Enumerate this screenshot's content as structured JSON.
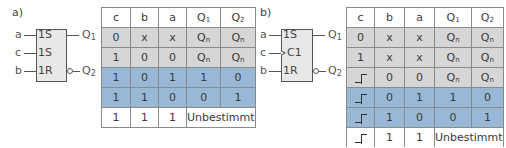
{
  "panels": [
    {
      "label": "a)",
      "block": {
        "inputs": [
          {
            "signal": "a",
            "pin": "1S"
          },
          {
            "signal": "c",
            "pin": "1S"
          },
          {
            "signal": "b",
            "pin": "1R"
          }
        ],
        "outputs": [
          {
            "name": "Q",
            "sub": "1",
            "inverted": false
          },
          {
            "name": "Q",
            "sub": "2",
            "inverted": true
          }
        ]
      },
      "table": {
        "headers": [
          "c",
          "b",
          "a",
          "Q1",
          "Q2"
        ],
        "rows": [
          {
            "style": "gray",
            "cells": [
              "0",
              "x",
              "x",
              "Qn",
              "Qn"
            ]
          },
          {
            "style": "gray",
            "cells": [
              "1",
              "0",
              "0",
              "Qn",
              "Qn"
            ]
          },
          {
            "style": "blue",
            "cells": [
              "1",
              "0",
              "1",
              "1",
              "0"
            ]
          },
          {
            "style": "blue",
            "cells": [
              "1",
              "1",
              "0",
              "0",
              "1"
            ]
          },
          {
            "style": "white",
            "cells": [
              "1",
              "1",
              "1",
              "Unbestimmt"
            ]
          }
        ]
      }
    },
    {
      "label": "b)",
      "block": {
        "inputs": [
          {
            "signal": "a",
            "pin": "1S"
          },
          {
            "signal": "c",
            "pin": "C1",
            "clock": true
          },
          {
            "signal": "b",
            "pin": "1R"
          }
        ],
        "outputs": [
          {
            "name": "Q",
            "sub": "1",
            "inverted": false
          },
          {
            "name": "Q",
            "sub": "2",
            "inverted": true
          }
        ]
      },
      "table": {
        "headers": [
          "c",
          "b",
          "a",
          "Q1",
          "Q2"
        ],
        "rows": [
          {
            "style": "gray",
            "cells": [
              "0",
              "x",
              "x",
              "Qn",
              "Qn"
            ]
          },
          {
            "style": "gray",
            "cells": [
              "1",
              "x",
              "x",
              "Qn",
              "Qn"
            ]
          },
          {
            "style": "gray",
            "cells": [
              "rising-edge",
              "0",
              "0",
              "Qn",
              "Qn"
            ]
          },
          {
            "style": "blue",
            "cells": [
              "rising-edge",
              "0",
              "1",
              "1",
              "0"
            ]
          },
          {
            "style": "blue",
            "cells": [
              "rising-edge",
              "1",
              "0",
              "0",
              "1"
            ]
          },
          {
            "style": "white",
            "cells": [
              "rising-edge",
              "1",
              "1",
              "Unbestimmt"
            ]
          }
        ]
      }
    }
  ],
  "colors": {
    "gray_row": "#d6d6d6",
    "blue_row": "#98b8d6",
    "block_fill": "#e8e8e8"
  },
  "text": {
    "qn_base": "Q",
    "qn_sub": "n",
    "q1_base": "Q",
    "q1_sub": "1",
    "q2_base": "Q",
    "q2_sub": "2"
  }
}
